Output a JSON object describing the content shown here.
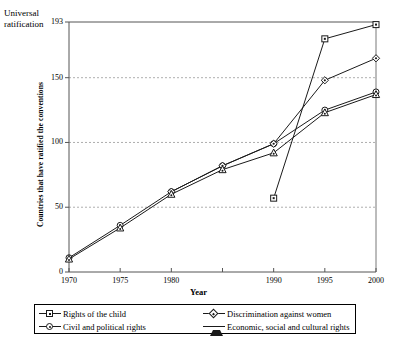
{
  "annotations": {
    "universal_ratification": "Universal\nratification"
  },
  "chart_data": {
    "type": "line",
    "title": "",
    "xlabel": "Year",
    "ylabel": "Countries that have ratified the conventions",
    "x": [
      1970,
      1975,
      1980,
      1985,
      1990,
      1995,
      2000
    ],
    "xtick_labels": [
      "1970",
      "1975",
      "1980",
      "",
      "1990",
      "1995",
      "2000"
    ],
    "ytick_labels": [
      "0",
      "50",
      "100",
      "150",
      "193"
    ],
    "yticks": [
      0,
      50,
      100,
      150,
      193
    ],
    "xlim": [
      1970,
      2000
    ],
    "ylim": [
      0,
      193
    ],
    "grid": "horizontal-dashed",
    "legend_position": "below-axes",
    "series": [
      {
        "name": "Rights of the child",
        "marker": "square",
        "x": [
          1990,
          1995,
          2000
        ],
        "values": [
          57,
          180,
          191
        ]
      },
      {
        "name": "Civil and political rights",
        "marker": "circle",
        "x": [
          1970,
          1975,
          1980,
          1985,
          1990,
          1995,
          2000
        ],
        "values": [
          11,
          36,
          62,
          82,
          99,
          125,
          139
        ]
      },
      {
        "name": "Discrimination against women",
        "marker": "diamond",
        "x": [
          1980,
          1985,
          1990,
          1995,
          2000
        ],
        "values": [
          62,
          82,
          99,
          148,
          165
        ]
      },
      {
        "name": "Economic, social and cultural rights",
        "marker": "triangle",
        "x": [
          1970,
          1975,
          1980,
          1985,
          1990,
          1995,
          2000
        ],
        "values": [
          10,
          34,
          60,
          79,
          92,
          123,
          137
        ]
      }
    ],
    "universal_ratification_level": 193
  },
  "legend": {
    "items": [
      {
        "label": "Rights of the child",
        "marker": "square"
      },
      {
        "label": "Civil and political rights",
        "marker": "circle"
      },
      {
        "label": "Discrimination against women",
        "marker": "diamond"
      },
      {
        "label": "Economic, social and cultural rights",
        "marker": "triangle"
      }
    ]
  },
  "colors": {
    "line": "#1a1a1a",
    "axis": "#555555",
    "grid": "#999999",
    "background": "#ffffff"
  }
}
